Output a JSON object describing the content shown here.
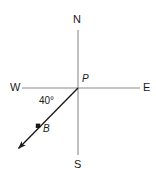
{
  "figure": {
    "background_color": "#ffffff",
    "axis_color": "#8c8c8c",
    "ray_color": "#1a1a1a",
    "text_color": "#1a1a1a",
    "labels": {
      "north": "N",
      "south": "S",
      "east": "E",
      "west": "W",
      "origin": "P",
      "point_b": "B",
      "angle": "40°"
    }
  },
  "chart_data": {
    "type": "scatter",
    "xlabel": "",
    "ylabel": "",
    "grid": false,
    "legend": null,
    "axes": {
      "vertical": {
        "label_top": "N",
        "label_bottom": "S",
        "x": 78,
        "y_top": 30,
        "y_bottom": 155
      },
      "horizontal": {
        "label_left": "W",
        "label_right": "E",
        "y": 88,
        "x_left": 22,
        "x_right": 140
      }
    },
    "points": [
      {
        "name": "P",
        "x": 78,
        "y": 88,
        "role": "origin",
        "marker": "none"
      },
      {
        "name": "B",
        "x": 38,
        "y": 126,
        "role": "point-on-ray",
        "marker": "dot"
      }
    ],
    "rays": [
      {
        "name": "PB",
        "from": "P",
        "from_xy": [
          78,
          88
        ],
        "to_xy": [
          15,
          152
        ],
        "arrow": true,
        "color": "#1a1a1a"
      }
    ],
    "annotations": [
      {
        "name": "angle-40",
        "text": "40°",
        "value": 40,
        "unit": "degrees",
        "measured_between": [
          "W",
          "PB"
        ],
        "x": 39,
        "y": 96
      }
    ]
  }
}
